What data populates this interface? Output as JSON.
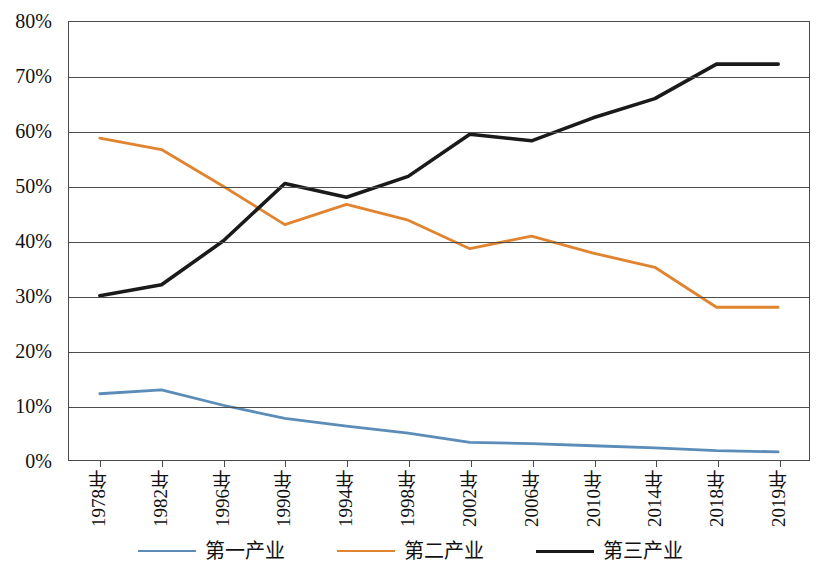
{
  "chart_data": {
    "type": "line",
    "title": "",
    "subtitle": "",
    "xlabel": "",
    "ylabel": "",
    "ylim": [
      0,
      80
    ],
    "ytick_step": 10,
    "ytick_labels": [
      "80%",
      "70%",
      "60%",
      "50%",
      "40%",
      "30%",
      "20%",
      "10%",
      "0%"
    ],
    "ytick_values": [
      80,
      70,
      60,
      50,
      40,
      30,
      20,
      10,
      0
    ],
    "grid": true,
    "grid_axis": "y",
    "legend_position": "bottom",
    "categories": [
      "1978年",
      "1982年",
      "1996年",
      "1990年",
      "1994年",
      "1998年",
      "2002年",
      "2006年",
      "2010年",
      "2014年",
      "2018年",
      "2019年"
    ],
    "series": [
      {
        "name": "第一产业",
        "color": "#5B8DB8",
        "values": [
          12.1,
          12.8,
          10.0,
          7.6,
          6.2,
          4.9,
          3.2,
          3.0,
          2.6,
          2.2,
          1.7,
          1.5
        ]
      },
      {
        "name": "第二产业",
        "color": "#E0842F",
        "values": [
          58.8,
          56.7,
          50.0,
          43.0,
          46.7,
          43.8,
          38.6,
          40.9,
          37.8,
          35.2,
          27.9,
          27.9
        ]
      },
      {
        "name": "第三产业",
        "color": "#1A1A1A",
        "values": [
          30.0,
          32.0,
          40.0,
          50.5,
          48.0,
          51.8,
          59.5,
          58.3,
          62.5,
          66.0,
          72.3,
          72.3
        ]
      }
    ]
  },
  "legend": {
    "items": [
      {
        "label": "第一产业",
        "color": "#5B8DB8"
      },
      {
        "label": "第二产业",
        "color": "#E0842F"
      },
      {
        "label": "第三产业",
        "color": "#1A1A1A"
      }
    ]
  }
}
